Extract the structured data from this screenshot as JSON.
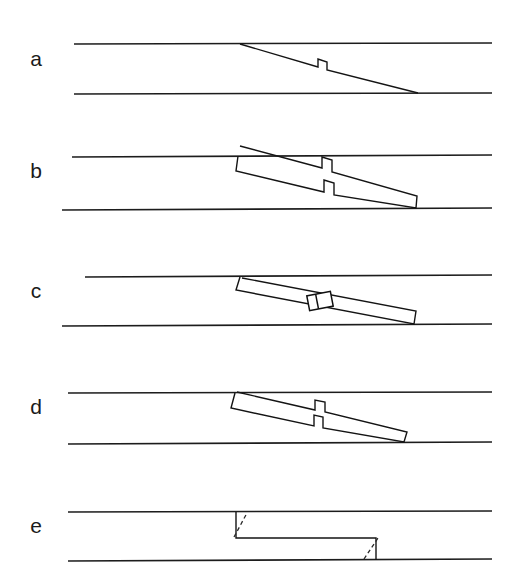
{
  "figure": {
    "background_color": "#ffffff",
    "line_color": "#1c1c1c",
    "width": 518,
    "height": 586,
    "panel_labels": [
      {
        "id": "a",
        "text": "a",
        "x": 36,
        "y": 60
      },
      {
        "id": "b",
        "text": "b",
        "x": 36,
        "y": 172
      },
      {
        "id": "c",
        "text": "c",
        "x": 36,
        "y": 292
      },
      {
        "id": "d",
        "text": "d",
        "x": 36,
        "y": 408
      },
      {
        "id": "e",
        "text": "e",
        "x": 36,
        "y": 527
      }
    ]
  },
  "chart_data": {
    "type": "diagram",
    "xlabel": "",
    "ylabel": "",
    "panels": [
      {
        "id": "a",
        "label": "a",
        "description": "Single line trace cutting across the layer with a small step-over notch",
        "wall_lines": [
          {
            "name": "upper-wall",
            "x1": 74,
            "y1": 44,
            "x2": 492,
            "y2": 43
          },
          {
            "name": "lower-wall",
            "x1": 74,
            "y1": 94,
            "x2": 492,
            "y2": 93
          }
        ],
        "traces": [
          {
            "name": "vein-trace",
            "points": "240,44 318,67 318,59 327,62 327,70 418,93"
          }
        ],
        "boxes": [],
        "dashes": []
      },
      {
        "id": "b",
        "label": "b",
        "description": "Closed vein band between walls with step-over jog in the middle",
        "wall_lines": [
          {
            "name": "upper-wall",
            "x1": 72,
            "y1": 157,
            "x2": 492,
            "y2": 155
          },
          {
            "name": "lower-wall",
            "x1": 62,
            "y1": 210,
            "x2": 492,
            "y2": 208
          }
        ],
        "traces": [],
        "boxes": [],
        "dashes": [],
        "band": {
          "name": "vein-band",
          "points": "238,156 236,171 324,192 324,180 334,183 334,195 416,208 417,196 332,172 332,160 322,157 322,168 240,146"
        }
      },
      {
        "id": "c",
        "label": "c",
        "description": "Continuous vein band with small rectangular bridge structure mid-band",
        "wall_lines": [
          {
            "name": "upper-wall",
            "x1": 85,
            "y1": 277,
            "x2": 492,
            "y2": 275
          },
          {
            "name": "lower-wall",
            "x1": 62,
            "y1": 326,
            "x2": 492,
            "y2": 324
          }
        ],
        "traces": [],
        "band": {
          "name": "vein-band",
          "points": "240,277 236,290 414,324 416,311 242,278"
        },
        "boxes": [
          {
            "name": "bridge-box",
            "cx": 320,
            "cy": 301,
            "width": 24,
            "height": 15,
            "rotation": -11,
            "divider_offset": 9
          }
        ],
        "dashes": []
      },
      {
        "id": "d",
        "label": "d",
        "description": "Thin closed vein band with step-over jog, terminating short of the lower wall",
        "wall_lines": [
          {
            "name": "upper-wall",
            "x1": 68,
            "y1": 393,
            "x2": 492,
            "y2": 392
          },
          {
            "name": "lower-wall",
            "x1": 68,
            "y1": 444,
            "x2": 492,
            "y2": 442
          }
        ],
        "traces": [],
        "band": {
          "name": "vein-band",
          "points": "235,393 231,408 314,426 314,415 323,417 323,428 404,442 407,432 325,412 325,402 315,400 315,410 237,392"
        },
        "boxes": [],
        "dashes": []
      },
      {
        "id": "e",
        "label": "e",
        "description": "Rectangular staircase step-over linking the two walls, with dashed original traces",
        "wall_lines": [
          {
            "name": "upper-wall",
            "x1": 68,
            "y1": 512,
            "x2": 492,
            "y2": 511
          },
          {
            "name": "lower-wall",
            "x1": 68,
            "y1": 561,
            "x2": 492,
            "y2": 559
          }
        ],
        "traces": [
          {
            "name": "step-trace",
            "points": "236,512 236,538 376,538 376,560"
          }
        ],
        "boxes": [],
        "dashes": [
          {
            "name": "dashed-marker-left",
            "x1": 234,
            "y1": 537,
            "x2": 247,
            "y2": 513
          },
          {
            "name": "dashed-marker-right",
            "x1": 364,
            "y1": 559,
            "x2": 378,
            "y2": 538
          }
        ]
      }
    ]
  }
}
